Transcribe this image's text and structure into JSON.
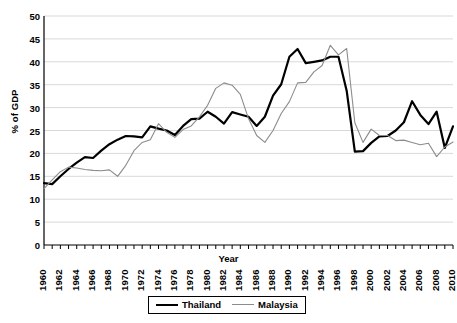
{
  "chart_data": {
    "type": "line",
    "title": "",
    "xlabel": "Year",
    "ylabel": "% of GDP",
    "xlim": [
      1960,
      2010
    ],
    "ylim": [
      0,
      50
    ],
    "grid": true,
    "legend_position": "bottom-center",
    "y_ticks": [
      0,
      5,
      10,
      15,
      20,
      25,
      30,
      35,
      40,
      45,
      50
    ],
    "x_tick_labels": [
      "1960",
      "1962",
      "1964",
      "1966",
      "1968",
      "1970",
      "1972",
      "1974",
      "1976",
      "1978",
      "1980",
      "1982",
      "1984",
      "1986",
      "1988",
      "1990",
      "1992",
      "1994",
      "1996",
      "1998",
      "2000",
      "2002",
      "2004",
      "2006",
      "2008",
      "2010"
    ],
    "x": [
      1960,
      1961,
      1962,
      1963,
      1964,
      1965,
      1966,
      1967,
      1968,
      1969,
      1970,
      1971,
      1972,
      1973,
      1974,
      1975,
      1976,
      1977,
      1978,
      1979,
      1980,
      1981,
      1982,
      1983,
      1984,
      1985,
      1986,
      1987,
      1988,
      1989,
      1990,
      1991,
      1992,
      1993,
      1994,
      1995,
      1996,
      1997,
      1998,
      1999,
      2000,
      2001,
      2002,
      2003,
      2004,
      2005,
      2006,
      2007,
      2008,
      2009,
      2010
    ],
    "series": [
      {
        "name": "Thailand",
        "color": "#000000",
        "line_width": 2.2,
        "values": [
          13.5,
          13.3,
          15.0,
          16.6,
          18.0,
          19.2,
          19.0,
          20.6,
          22.0,
          23.0,
          23.8,
          23.7,
          23.5,
          25.9,
          25.4,
          25.0,
          24.0,
          26.0,
          27.5,
          27.6,
          29.1,
          28.0,
          26.5,
          29.0,
          28.5,
          28.0,
          26.0,
          28.0,
          32.6,
          35.1,
          41.1,
          42.8,
          39.7,
          40.0,
          40.3,
          41.1,
          41.1,
          33.7,
          20.4,
          20.5,
          22.3,
          23.7,
          23.8,
          25.0,
          26.8,
          31.4,
          28.4,
          26.4,
          29.1,
          21.2,
          25.9
        ]
      },
      {
        "name": "Malaysia",
        "color": "#8c8c8c",
        "line_width": 1.1,
        "values": [
          12.3,
          14.2,
          16.0,
          17.0,
          16.8,
          16.5,
          16.3,
          16.2,
          16.4,
          15.0,
          17.4,
          20.6,
          22.4,
          23.0,
          26.5,
          24.6,
          23.5,
          25.2,
          26.0,
          28.0,
          30.5,
          34.2,
          35.4,
          34.9,
          32.9,
          27.6,
          23.9,
          22.4,
          25.0,
          28.7,
          31.3,
          35.4,
          35.5,
          37.8,
          39.2,
          43.6,
          41.5,
          42.9,
          26.7,
          22.4,
          25.3,
          23.9,
          23.9,
          22.8,
          22.9,
          22.4,
          21.9,
          22.2,
          19.3,
          21.4,
          22.5
        ]
      }
    ]
  },
  "legend": {
    "entries": [
      {
        "label": "Thailand"
      },
      {
        "label": "Malaysia"
      }
    ]
  },
  "colors": {
    "thailand": "#000000",
    "malaysia": "#8c8c8c",
    "gridline": "#d9d9d9",
    "axis": "#000000",
    "background": "#ffffff"
  }
}
